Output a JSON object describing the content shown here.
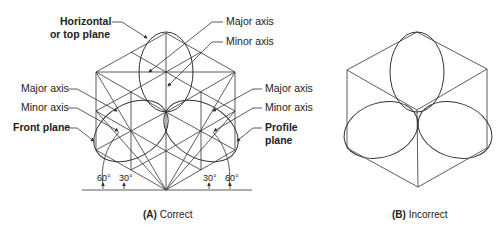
{
  "figure_a": {
    "caption_letter": "(A)",
    "caption_text": "Correct",
    "labels": {
      "top_plane_line1": "Horizontal",
      "top_plane_line2": "or top plane",
      "top_major_axis": "Major axis",
      "top_minor_axis": "Minor axis",
      "left_major_axis": "Major axis",
      "left_minor_axis": "Minor axis",
      "front_plane": "Front plane",
      "right_major_axis": "Major axis",
      "right_minor_axis": "Minor axis",
      "profile_plane_line1": "Profile",
      "profile_plane_line2": "plane"
    },
    "angles": [
      "60°",
      "30°",
      "30°",
      "60°"
    ]
  },
  "figure_b": {
    "caption_letter": "(B)",
    "caption_text": "Incorrect"
  },
  "colors": {
    "line": "#333333",
    "text": "#222222",
    "background": "#ffffff"
  }
}
